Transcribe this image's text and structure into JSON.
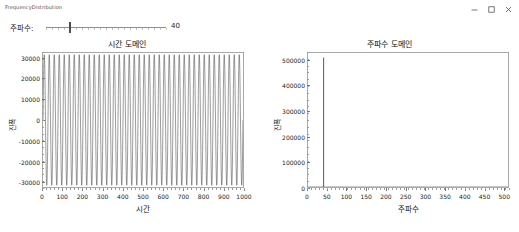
{
  "window": {
    "title": "FrequencyDistribution",
    "controls": [
      {
        "name": "minimize-button",
        "glyph": "minimize"
      },
      {
        "name": "maximize-button",
        "glyph": "maximize"
      },
      {
        "name": "close-button",
        "glyph": "close"
      }
    ]
  },
  "controls": {
    "frequency_label": "주파수:",
    "frequency_value": "40",
    "frequency_min": 0,
    "frequency_max": 200,
    "frequency_current": 40
  },
  "chart_data": [
    {
      "id": "time-domain",
      "type": "line",
      "title": "시간 도메인",
      "xlabel": "시간",
      "ylabel": "진폭",
      "xlim": [
        0,
        1000
      ],
      "ylim": [
        -32767,
        32767
      ],
      "xticks": [
        0,
        100,
        200,
        300,
        400,
        500,
        600,
        700,
        800,
        900,
        1000
      ],
      "xtick_labels": [
        "0",
        "100",
        "200",
        "300",
        "400",
        "500",
        "600",
        "700",
        "800",
        "900",
        "1000"
      ],
      "yticks": [
        -30000,
        -20000,
        -10000,
        0,
        10000,
        20000,
        30000
      ],
      "ytick_labels": [
        "-30000",
        "-20000",
        "-10000",
        "0",
        "10000",
        "20000",
        "30000"
      ],
      "grid": false,
      "series": [
        {
          "name": "sine",
          "waveform": "sine",
          "cycles": 40,
          "amplitude": 32000,
          "samples": 1000,
          "color": "#4a4a4a"
        }
      ]
    },
    {
      "id": "frequency-domain",
      "type": "line",
      "title": "주파수 도메인",
      "xlabel": "주파수",
      "ylabel": "진폭",
      "xlim": [
        0,
        512
      ],
      "ylim": [
        0,
        530000
      ],
      "xticks": [
        0,
        50,
        100,
        150,
        200,
        250,
        300,
        350,
        400,
        450,
        500
      ],
      "xtick_labels": [
        "0",
        "50",
        "100",
        "150",
        "200",
        "250",
        "300",
        "350",
        "400",
        "450",
        "500"
      ],
      "yticks": [
        0,
        100000,
        200000,
        300000,
        400000,
        500000
      ],
      "ytick_labels": [
        "0",
        "100000",
        "200000",
        "300000",
        "400000",
        "500000"
      ],
      "grid": false,
      "series": [
        {
          "name": "magnitude",
          "peak_x": 40,
          "peak_y": 512000,
          "baseline": 0,
          "color": "#4a4a4a"
        }
      ]
    }
  ]
}
